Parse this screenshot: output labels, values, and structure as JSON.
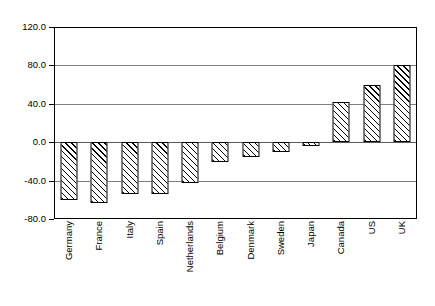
{
  "chart_data": {
    "type": "bar",
    "title": "",
    "subtitle": "",
    "xlabel": "",
    "ylabel": "",
    "ylim": [
      -80.0,
      120.0
    ],
    "ytick_labels": [
      "120.0",
      "80.0",
      "40.0",
      "0.0",
      "-40.0",
      "-80.0"
    ],
    "ytick_values": [
      120.0,
      80.0,
      40.0,
      0.0,
      -40.0,
      -80.0
    ],
    "grid": true,
    "legend": "none",
    "categories": [
      "Germany",
      "France",
      "Italy",
      "Spain",
      "Netherlands",
      "Belgium",
      "Denmark",
      "Sweden",
      "Japan",
      "Canada",
      "US",
      "UK"
    ],
    "values": [
      -60,
      -63,
      -54,
      -54,
      -42,
      -21,
      -15,
      -10,
      -4,
      42,
      60,
      80
    ],
    "series": [
      {
        "name": "",
        "values": [
          -60,
          -63,
          -54,
          -54,
          -42,
          -21,
          -15,
          -10,
          -4,
          42,
          60,
          80
        ]
      }
    ],
    "bar_fill": "black-diagonal-hatch",
    "bar_outline_color": "#000000",
    "plot_background": "#ffffff",
    "gridline_color": "#808080"
  }
}
